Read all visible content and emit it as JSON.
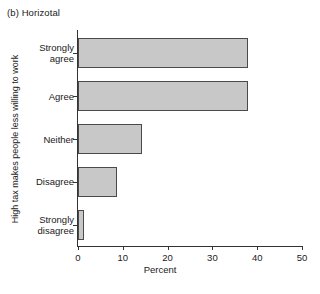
{
  "figure": {
    "title": "(b) Horizotal",
    "bar_fill_color": "#c8c8c8",
    "bar_edge_color": "#4a4a4a",
    "axis_color": "#333333",
    "background_color": "#ffffff"
  },
  "chart_data": {
    "type": "bar",
    "orientation": "horizontal",
    "title": "(b) Horizotal",
    "subtitle": "",
    "xlabel": "Percent",
    "ylabel": "High tax makes people less willing to work",
    "categories": [
      "Strongly agree",
      "Agree",
      "Neither",
      "Disagree",
      "Strongly disagree"
    ],
    "values": [
      38.0,
      38.0,
      14.3,
      8.8,
      1.3
    ],
    "xlim": [
      0,
      50
    ],
    "xticks": [
      0,
      10,
      20,
      30,
      40,
      50
    ],
    "xticklabels": [
      "0",
      "10",
      "20",
      "30",
      "40",
      "50"
    ],
    "grid": false,
    "legend": null
  }
}
